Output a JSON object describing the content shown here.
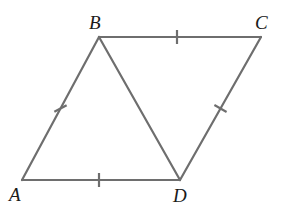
{
  "figure": {
    "type": "geometry-diagram",
    "background_color": "#ffffff",
    "stroke_color": "#6e6e6e",
    "label_color": "#1a1a1a",
    "stroke_width": 2.2,
    "canvas": {
      "width": 285,
      "height": 212
    }
  },
  "vertices": [
    {
      "id": "A",
      "label": "A",
      "x": 22,
      "y": 180,
      "label_x": 9,
      "label_y": 201
    },
    {
      "id": "B",
      "label": "B",
      "x": 99,
      "y": 37,
      "label_x": 89,
      "label_y": 29
    },
    {
      "id": "C",
      "label": "C",
      "x": 261,
      "y": 37,
      "label_x": 255,
      "label_y": 29
    },
    {
      "id": "D",
      "label": "D",
      "x": 180,
      "y": 180,
      "label_x": 173,
      "label_y": 202
    }
  ],
  "segments": [
    {
      "id": "AB",
      "from": "A",
      "to": "B",
      "x1": 22,
      "y1": 180,
      "x2": 99,
      "y2": 37,
      "ticks": 1
    },
    {
      "id": "BC",
      "from": "B",
      "to": "C",
      "x1": 99,
      "y1": 37,
      "x2": 261,
      "y2": 37,
      "ticks": 1
    },
    {
      "id": "CD",
      "from": "C",
      "to": "D",
      "x1": 261,
      "y1": 37,
      "x2": 180,
      "y2": 180,
      "ticks": 1
    },
    {
      "id": "DA",
      "from": "D",
      "to": "A",
      "x1": 180,
      "y1": 180,
      "x2": 22,
      "y2": 180,
      "ticks": 1
    },
    {
      "id": "BD",
      "from": "B",
      "to": "D",
      "x1": 99,
      "y1": 37,
      "x2": 180,
      "y2": 180,
      "ticks": 0
    }
  ],
  "tick_marks": [
    {
      "id": "tick-AB",
      "segment": "AB",
      "cx": 60.5,
      "cy": 108.5,
      "angle_deg": 61.7,
      "length": 14
    },
    {
      "id": "tick-BC",
      "segment": "BC",
      "cx": 177,
      "cy": 37,
      "angle_deg": 0,
      "length": 14
    },
    {
      "id": "tick-CD",
      "segment": "CD",
      "cx": 220.5,
      "cy": 108.5,
      "angle_deg": -60.5,
      "length": 14
    },
    {
      "id": "tick-DA",
      "segment": "DA",
      "cx": 99,
      "cy": 180,
      "angle_deg": 0,
      "length": 14
    }
  ]
}
